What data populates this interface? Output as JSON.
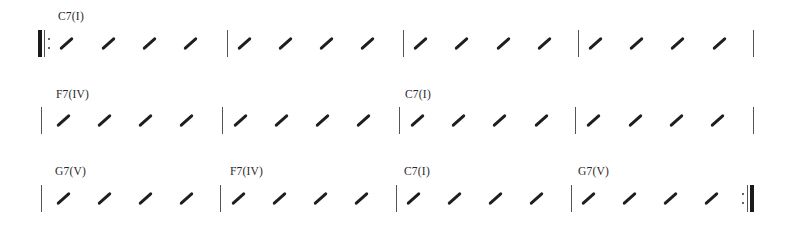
{
  "time_signature_beats_per_measure": 4,
  "systems": [
    {
      "start_repeat": true,
      "end_repeat": false,
      "measures": [
        {
          "chord": "C7(I)",
          "beats": 4
        },
        {
          "chord": "",
          "beats": 4
        },
        {
          "chord": "",
          "beats": 4
        },
        {
          "chord": "",
          "beats": 4
        }
      ]
    },
    {
      "start_repeat": false,
      "end_repeat": false,
      "measures": [
        {
          "chord": "F7(IV)",
          "beats": 4
        },
        {
          "chord": "",
          "beats": 4
        },
        {
          "chord": "C7(I)",
          "beats": 4
        },
        {
          "chord": "",
          "beats": 4
        }
      ]
    },
    {
      "start_repeat": false,
      "end_repeat": true,
      "measures": [
        {
          "chord": "G7(V)",
          "beats": 4
        },
        {
          "chord": "F7(IV)",
          "beats": 4
        },
        {
          "chord": "C7(I)",
          "beats": 4
        },
        {
          "chord": "G7(V)",
          "beats": 4
        }
      ]
    }
  ],
  "colors": {
    "barline": "#555555",
    "slash": "#1e1e1e",
    "text": "#2a2a2a",
    "background": "#ffffff"
  }
}
